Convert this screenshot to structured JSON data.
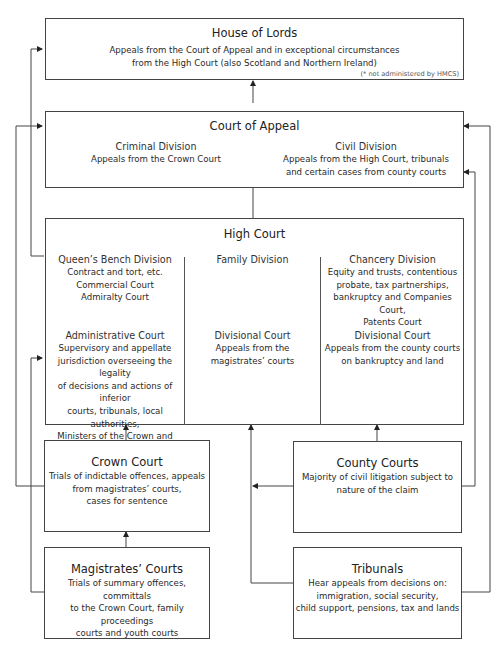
{
  "diagram": {
    "house_of_lords": {
      "title": "House of Lords",
      "lines": [
        "Appeals from the Court of Appeal and in exceptional circumstances",
        "from the High Court (also Scotland and Northern Ireland)"
      ],
      "note": "(* not administered by HMCS)"
    },
    "court_of_appeal": {
      "title": "Court of Appeal",
      "criminal": {
        "title": "Criminal Division",
        "lines": [
          "Appeals from the Crown Court"
        ]
      },
      "civil": {
        "title": "Civil Division",
        "lines": [
          "Appeals from the High Court, tribunals",
          "and certain cases from county courts"
        ]
      }
    },
    "high_court": {
      "title": "High Court",
      "queens_bench": {
        "title": "Queen’s Bench Division",
        "lines": [
          "Contract and tort, etc.",
          "Commercial Court",
          "Admiralty Court"
        ]
      },
      "family": {
        "title": "Family Division"
      },
      "chancery": {
        "title": "Chancery Division",
        "lines": [
          "Equity and trusts, contentious",
          "probate, tax partnerships,",
          "bankruptcy and Companies Court,",
          "Patents Court"
        ]
      },
      "administrative": {
        "title": "Administrative Court",
        "lines": [
          "Supervisory and appellate",
          "jurisdiction overseeing the legality",
          "of decisions and actions of inferior",
          "courts, tribunals, local authorities,",
          "Ministers of the Crown and other",
          "public bodies and officials"
        ]
      },
      "family_divisional": {
        "title": "Divisional Court",
        "lines": [
          "Appeals from the",
          "magistrates’ courts"
        ]
      },
      "chancery_divisional": {
        "title": "Divisional Court",
        "lines": [
          "Appeals from the county courts",
          "on bankruptcy and land"
        ]
      }
    },
    "crown_court": {
      "title": "Crown Court",
      "lines": [
        "Trials of indictable offences, appeals",
        "from magistrates’ courts,",
        "cases for sentence"
      ]
    },
    "county_courts": {
      "title": "County Courts",
      "lines": [
        "Majority of civil litigation subject to",
        "nature of the claim"
      ]
    },
    "magistrates_courts": {
      "title": "Magistrates’ Courts",
      "lines": [
        "Trials of summary offences, committals",
        "to the Crown Court, family proceedings",
        "courts and youth courts"
      ]
    },
    "tribunals": {
      "title": "Tribunals",
      "lines": [
        "Hear appeals from decisions on:",
        "immigration, social security,",
        "child support, pensions, tax and lands"
      ]
    }
  }
}
